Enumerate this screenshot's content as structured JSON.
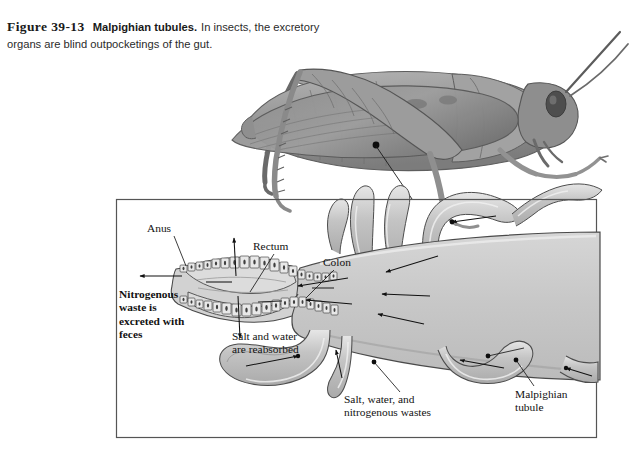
{
  "caption": {
    "figure_number": "Figure 39-13",
    "figure_title": "Malpighian tubules.",
    "figure_body": "In insects, the excretory organs are blind outpocketings of the gut."
  },
  "diagram": {
    "organism": "grasshopper",
    "labels": {
      "anus": "Anus",
      "rectum": "Rectum",
      "colon": "Colon",
      "nitrogenous_waste": "Nitrogenous\nwaste is\nexcreted with\nfeces",
      "salt_water_reabsorbed": "Salt and water\nare reabsorbed",
      "salt_water_nitrogenous": "Salt, water, and\nnitrogenous wastes",
      "malpighian_tubule": "Malpighian\ntubule"
    }
  },
  "colors": {
    "ink": "#1a1a1a",
    "outline": "#3a3a3a",
    "gut_fill": "#c9c9c9",
    "tubule_fill": "#bdbdbd",
    "tubule_highlight": "#e8e8e8",
    "epithelium_fill": "#e3e3e3",
    "box_border": "#555555",
    "page_background": "#ffffff",
    "insect_body": "#9a9a9a"
  }
}
